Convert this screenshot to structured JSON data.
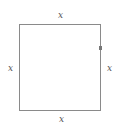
{
  "diagram": {
    "shape": "square",
    "labels": {
      "top": "x",
      "bottom": "x",
      "left": "x",
      "right": "x"
    },
    "colors": {
      "stroke": "#8a8a8a",
      "label": "#555555"
    }
  }
}
